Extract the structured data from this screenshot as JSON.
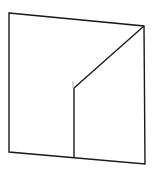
{
  "diagram": {
    "background": "#ffffff",
    "stroke_color": "#1a1a1a",
    "stroke_faint": "#aaaaaa",
    "outer_quad": {
      "top_left": [
        9,
        13
      ],
      "top_right": [
        144,
        26
      ],
      "bottom_right": [
        145,
        164
      ],
      "bottom_left": [
        9,
        152
      ]
    },
    "inner_lines": [
      {
        "name": "diagonal",
        "from": [
          144,
          26
        ],
        "to": [
          74,
          88
        ]
      },
      {
        "name": "vertical",
        "from": [
          74,
          88
        ],
        "to": [
          74,
          157
        ]
      },
      {
        "name": "faint-stub",
        "from": [
          73,
          81
        ],
        "to": [
          73,
          88
        ]
      }
    ]
  }
}
